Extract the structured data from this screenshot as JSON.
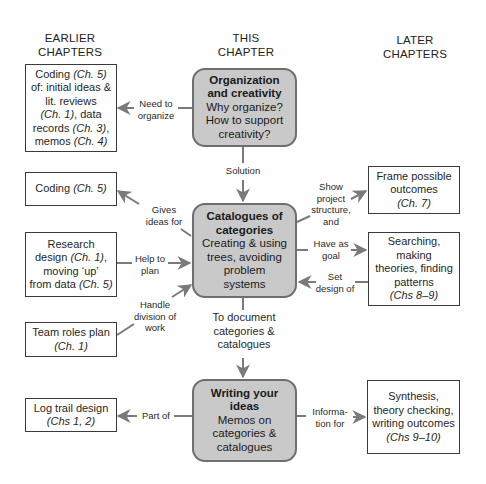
{
  "headers": {
    "earlier": [
      "EARLIER",
      "CHAPTERS"
    ],
    "this": [
      "THIS",
      "CHAPTER"
    ],
    "later": [
      "LATER",
      "CHAPTERS"
    ]
  },
  "center": {
    "organization": {
      "title": [
        "Organization",
        "and creativity"
      ],
      "body": [
        "Why organize?",
        "How to support",
        "creativity?"
      ]
    },
    "catalogues": {
      "title": [
        "Catalogues of",
        "categories"
      ],
      "body": [
        "Creating & using",
        "trees, avoiding",
        "problem",
        "systems"
      ]
    },
    "writing": {
      "title": [
        "Writing your",
        "ideas"
      ],
      "body": [
        "Memos on",
        "categories &",
        "catalogues"
      ]
    }
  },
  "earlier": {
    "coding_initial": {
      "lines": [
        {
          "t": "Coding ",
          "c": "(Ch. 5)"
        },
        {
          "t": "of: initial ideas &",
          "c": ""
        },
        {
          "t": "lit. reviews",
          "c": ""
        },
        {
          "t": "",
          "c": "(Ch. 1)",
          "t2": ", data"
        },
        {
          "t": "records ",
          "c": "(Ch. 3)",
          "t2": ","
        },
        {
          "t": "memos ",
          "c": "(Ch. 4)"
        }
      ]
    },
    "coding": {
      "text": "Coding ",
      "chapter": "(Ch. 5)"
    },
    "research": {
      "line1": "Research",
      "line2": "design ",
      "line2c": "(Ch. 1)",
      "line2e": ",",
      "line3": "moving ‘up’",
      "line4": "from data ",
      "line4c": "(Ch. 5)"
    },
    "team": {
      "text": "Team roles plan",
      "chapter": "(Ch. 1)"
    },
    "log": {
      "text": "Log trail design",
      "chapter": "(Chs 1, 2)"
    }
  },
  "later": {
    "frame": {
      "lines": [
        "Frame possible",
        "outcomes"
      ],
      "chapter": "(Ch. 7)"
    },
    "searching": {
      "lines": [
        "Searching,",
        "making",
        "theories, finding",
        "patterns"
      ],
      "chapter": "(Chs 8–9)"
    },
    "synthesis": {
      "lines": [
        "Synthesis,",
        "theory checking,",
        "writing outcomes"
      ],
      "chapter": "(Chs 9–10)"
    }
  },
  "connectors": {
    "need_to_organize": [
      "Need to",
      "organize"
    ],
    "solution": [
      "Solution"
    ],
    "gives_ideas_for": [
      "Gives",
      "ideas for"
    ],
    "help_to_plan": [
      "Help to",
      "plan"
    ],
    "handle_division": [
      "Handle",
      "division of",
      "work"
    ],
    "show_structure": [
      "Show",
      "project",
      "structure,",
      "and"
    ],
    "have_as_goal": [
      "Have as",
      "goal"
    ],
    "set_design_of": [
      "Set",
      "design of"
    ],
    "to_document": [
      "To document",
      "categories &",
      "catalogues"
    ],
    "part_of": [
      "Part of"
    ],
    "information_for": [
      "Informa-",
      "tion for"
    ]
  },
  "colors": {
    "center_fill": "#c9c9c9",
    "center_border": "#6e6e6e",
    "arrow": "#7a7a7a",
    "box_border": "#3a3a3a"
  }
}
